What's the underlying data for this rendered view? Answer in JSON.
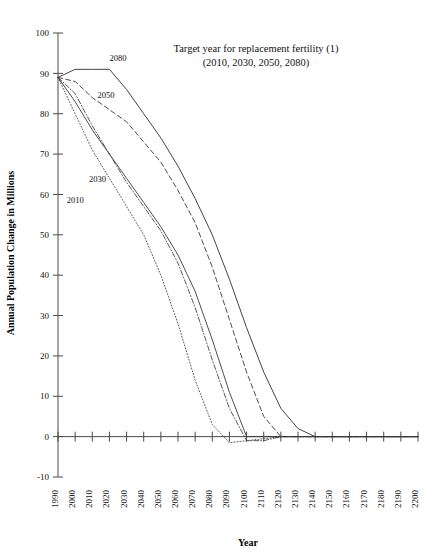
{
  "chart_data": {
    "type": "line",
    "title": "Target year for replacement fertility (1)",
    "subtitle": "(2010, 2030, 2050, 2080)",
    "xlabel": "Year",
    "ylabel": "Annual Population Change in Millions",
    "xlim": [
      1990,
      2200
    ],
    "ylim": [
      -10,
      100
    ],
    "grid": false,
    "legend_position": "inline-labels",
    "xticks": [
      "1990",
      "2000",
      "2010",
      "2020",
      "2030",
      "2040",
      "2050",
      "2060",
      "2070",
      "2080",
      "2090",
      "2100",
      "2110",
      "2120",
      "2130",
      "2140",
      "2150",
      "2160",
      "2170",
      "2180",
      "2190",
      "2200"
    ],
    "yticks": [
      "-10",
      "0",
      "10",
      "20",
      "30",
      "40",
      "50",
      "60",
      "70",
      "80",
      "90",
      "100"
    ],
    "x": [
      1990,
      2000,
      2010,
      2020,
      2030,
      2040,
      2050,
      2060,
      2070,
      2080,
      2090,
      2100,
      2110,
      2120,
      2130,
      2140,
      2150,
      2160,
      2170,
      2180,
      2190,
      2200
    ],
    "series": [
      {
        "name": "2010",
        "label": "2010",
        "label_x": 2000,
        "label_y": 58,
        "style": "dotted",
        "values": [
          89,
          80,
          71,
          64,
          57,
          50,
          40,
          28,
          14,
          3,
          -1.5,
          -1,
          -0.5,
          0,
          0,
          0,
          0,
          0,
          0,
          0,
          0,
          0
        ]
      },
      {
        "name": "2030",
        "label": "2030",
        "label_x": 2013,
        "label_y": 63,
        "style": "dash-dot",
        "values": [
          89,
          85,
          77,
          70,
          63,
          57,
          51,
          43,
          32,
          19,
          7,
          -1,
          -1,
          0,
          0,
          0,
          0,
          0,
          0,
          0,
          0,
          0
        ]
      },
      {
        "name": "2050",
        "label": "2050",
        "label_x": 2018,
        "label_y": 84,
        "style": "dashed",
        "values": [
          89,
          88,
          84,
          81,
          78,
          73,
          68,
          61,
          53,
          42,
          29,
          16,
          5,
          0,
          0,
          0,
          0,
          0,
          0,
          0,
          0,
          0
        ]
      },
      {
        "name": "2080",
        "label": "2080",
        "label_x": 2025,
        "label_y": 93,
        "style": "solid",
        "values": [
          89,
          91,
          91,
          91,
          86,
          80,
          74,
          67,
          59,
          50,
          39,
          27,
          16,
          7,
          2,
          0,
          0,
          0,
          0,
          0,
          0,
          0
        ]
      },
      {
        "name": "2030-light",
        "label": "",
        "label_x": 0,
        "label_y": 0,
        "style": "solid-light",
        "values": [
          89,
          83,
          76,
          70,
          64,
          58,
          52,
          45,
          36,
          24,
          11,
          0,
          0,
          0,
          0,
          0,
          0,
          0,
          0,
          0,
          0,
          0
        ]
      }
    ]
  }
}
